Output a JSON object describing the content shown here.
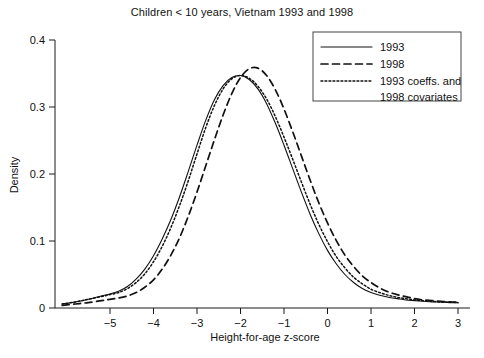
{
  "chart_data": {
    "type": "line",
    "title": "Children < 10 years, Vietnam 1993 and 1998",
    "xlabel": "Height-for-age z-score",
    "ylabel": "Density",
    "xlim": [
      -6.3,
      3.2
    ],
    "ylim": [
      0,
      0.42
    ],
    "xticks": [
      -5,
      -4,
      -3,
      -2,
      -1,
      0,
      1,
      2,
      3
    ],
    "xtick_labels": [
      "−5",
      "−4",
      "−3",
      "−2",
      "−1",
      "0",
      "1",
      "2",
      "3"
    ],
    "yticks": [
      0,
      0.1,
      0.2,
      0.3,
      0.4
    ],
    "ytick_labels": [
      "0",
      "0.1",
      "0.2",
      "0.3",
      "0.4"
    ],
    "grid": false,
    "legend_position": "top-right",
    "x": [
      -6.1,
      -5.8,
      -5.5,
      -5.2,
      -5.0,
      -4.8,
      -4.6,
      -4.4,
      -4.2,
      -4.0,
      -3.8,
      -3.6,
      -3.4,
      -3.2,
      -3.0,
      -2.8,
      -2.6,
      -2.4,
      -2.2,
      -2.0,
      -1.8,
      -1.6,
      -1.4,
      -1.2,
      -1.0,
      -0.8,
      -0.6,
      -0.4,
      -0.2,
      0.0,
      0.2,
      0.4,
      0.6,
      0.8,
      1.0,
      1.2,
      1.4,
      1.6,
      1.8,
      2.0,
      2.2,
      2.4,
      2.6,
      2.8,
      3.0
    ],
    "series": [
      {
        "name": "1993",
        "style": "solid",
        "values": [
          0.006,
          0.009,
          0.013,
          0.018,
          0.021,
          0.025,
          0.032,
          0.043,
          0.058,
          0.078,
          0.103,
          0.132,
          0.166,
          0.204,
          0.243,
          0.28,
          0.311,
          0.332,
          0.344,
          0.347,
          0.341,
          0.327,
          0.305,
          0.276,
          0.243,
          0.208,
          0.173,
          0.14,
          0.111,
          0.086,
          0.066,
          0.05,
          0.038,
          0.029,
          0.023,
          0.019,
          0.016,
          0.014,
          0.012,
          0.011,
          0.01,
          0.009,
          0.009,
          0.008,
          0.008
        ]
      },
      {
        "name": "1998",
        "style": "dashed",
        "values": [
          0.004,
          0.006,
          0.008,
          0.011,
          0.013,
          0.015,
          0.018,
          0.023,
          0.031,
          0.042,
          0.058,
          0.079,
          0.105,
          0.137,
          0.173,
          0.212,
          0.251,
          0.288,
          0.32,
          0.344,
          0.357,
          0.358,
          0.347,
          0.326,
          0.297,
          0.263,
          0.227,
          0.191,
          0.157,
          0.127,
          0.101,
          0.079,
          0.062,
          0.048,
          0.038,
          0.03,
          0.024,
          0.02,
          0.017,
          0.014,
          0.012,
          0.011,
          0.01,
          0.009,
          0.009
        ]
      },
      {
        "name": "1993 coeffs. and 1998 covariates",
        "style": "dotted",
        "values": [
          0.006,
          0.009,
          0.013,
          0.017,
          0.02,
          0.023,
          0.029,
          0.038,
          0.051,
          0.069,
          0.092,
          0.12,
          0.153,
          0.19,
          0.23,
          0.269,
          0.302,
          0.327,
          0.342,
          0.347,
          0.343,
          0.331,
          0.312,
          0.286,
          0.255,
          0.222,
          0.188,
          0.155,
          0.125,
          0.099,
          0.077,
          0.06,
          0.046,
          0.036,
          0.028,
          0.023,
          0.019,
          0.016,
          0.014,
          0.012,
          0.011,
          0.01,
          0.009,
          0.009,
          0.008
        ]
      }
    ],
    "legend": [
      {
        "label": "1993",
        "style": "solid"
      },
      {
        "label": "1998",
        "style": "dashed"
      },
      {
        "label": "1993 coeffs. and",
        "label2": "1998 covariates",
        "style": "dotted"
      }
    ]
  }
}
